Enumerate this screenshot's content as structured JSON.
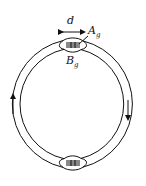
{
  "diagram": {
    "type": "toroidal core with air gaps",
    "labels": {
      "gap_width": "d",
      "gap_area_main": "A",
      "gap_area_sub": "g",
      "gap_field_main": "B",
      "gap_field_sub": "g"
    },
    "flux_direction": {
      "left": "up",
      "right": "down"
    },
    "gaps": [
      "top",
      "bottom"
    ],
    "stroke_color": "#111111",
    "background": "#ffffff"
  }
}
